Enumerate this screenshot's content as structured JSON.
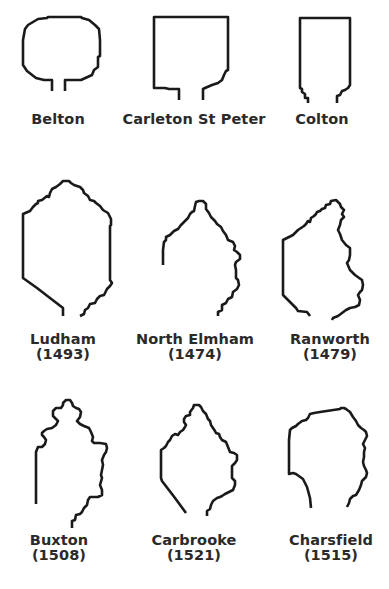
{
  "diagram": {
    "stroke_color": "#1a1a1a",
    "label_color": "#2a2a2a",
    "background": "#ffffff"
  },
  "rows": [
    {
      "items": [
        {
          "name": "Belton",
          "year": null
        },
        {
          "name": "Carleton St Peter",
          "year": null
        },
        {
          "name": "Colton",
          "year": null
        }
      ]
    },
    {
      "items": [
        {
          "name": "Ludham",
          "year": "(1493)"
        },
        {
          "name": "North Elmham",
          "year": "(1474)"
        },
        {
          "name": "Ranworth",
          "year": "(1479)"
        }
      ]
    },
    {
      "items": [
        {
          "name": "Buxton",
          "year": "(1508)"
        },
        {
          "name": "Carbrooke",
          "year": "(1521)"
        },
        {
          "name": "Charsfield",
          "year": "(1515)"
        }
      ]
    }
  ]
}
